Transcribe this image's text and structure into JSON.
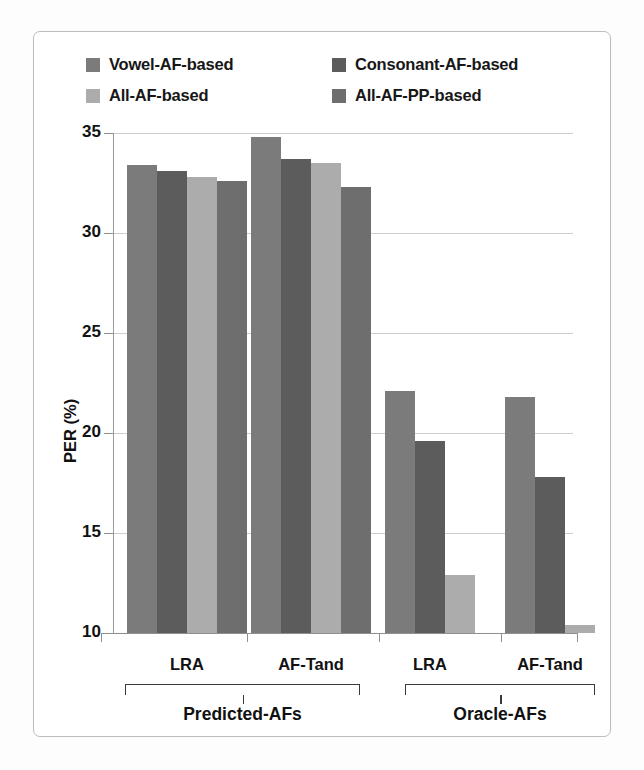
{
  "chart_data": {
    "type": "bar",
    "title": "",
    "xlabel": "",
    "ylabel": "PER (%)",
    "ylim": [
      10,
      35
    ],
    "yticks": [
      10,
      15,
      20,
      25,
      30,
      35
    ],
    "ytick_labels": [
      "10",
      "15",
      "20",
      "25",
      "30",
      "35"
    ],
    "grid": true,
    "legend_position": "top",
    "categories": [
      "LRA",
      "AF-Tand",
      "LRA",
      "AF-Tand"
    ],
    "group_labels": [
      "Predicted-AFs",
      "Oracle-AFs"
    ],
    "group_spans": [
      [
        "LRA",
        "AF-Tand"
      ],
      [
        "LRA",
        "AF-Tand"
      ]
    ],
    "series": [
      {
        "name": "Vowel-AF-based",
        "color": "#7b7b7b",
        "values": [
          33.4,
          34.8,
          22.1,
          21.8
        ]
      },
      {
        "name": "Consonant-AF-based",
        "color": "#5c5c5c",
        "values": [
          33.1,
          33.7,
          19.6,
          17.8
        ]
      },
      {
        "name": "All-AF-based",
        "color": "#acacac",
        "values": [
          32.8,
          33.5,
          12.9,
          10.4
        ]
      },
      {
        "name": "All-AF-PP-based",
        "color": "#6e6e6e",
        "values": [
          32.6,
          32.3,
          null,
          null
        ]
      }
    ]
  },
  "legend": {
    "items": [
      {
        "label": "Vowel-AF-based",
        "color": "#7b7b7b"
      },
      {
        "label": "Consonant-AF-based",
        "color": "#5c5c5c"
      },
      {
        "label": "All-AF-based",
        "color": "#acacac"
      },
      {
        "label": "All-AF-PP-based",
        "color": "#6e6e6e"
      }
    ]
  },
  "axis": {
    "y_title": "PER (%)",
    "y_ticks": [
      "35",
      "30",
      "25",
      "20",
      "15",
      "10"
    ]
  },
  "x_axis": {
    "tick_labels": [
      "LRA",
      "AF-Tand",
      "LRA",
      "AF-Tand"
    ]
  },
  "groups": {
    "labels": [
      "Predicted-AFs",
      "Oracle-AFs"
    ]
  }
}
